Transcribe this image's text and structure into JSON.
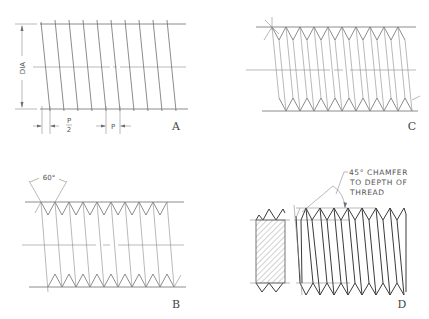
{
  "figure": {
    "views": [
      {
        "id": "A",
        "label": "A",
        "annotations": {
          "diameter": "DIA",
          "half_pitch": "P/2",
          "half_pitch_num": "P",
          "half_pitch_den": "2",
          "pitch": "P"
        }
      },
      {
        "id": "B",
        "label": "B",
        "annotations": {
          "angle": "60°"
        }
      },
      {
        "id": "C",
        "label": "C",
        "annotations": {}
      },
      {
        "id": "D",
        "label": "D",
        "annotations": {
          "note_line1": "45° CHAMFER",
          "note_line2": "TO DEPTH OF",
          "note_line3": "THREAD"
        }
      }
    ]
  },
  "colors": {
    "line": "#6e6e6e",
    "dark_line": "#3a3a3a",
    "background": "#ffffff"
  }
}
